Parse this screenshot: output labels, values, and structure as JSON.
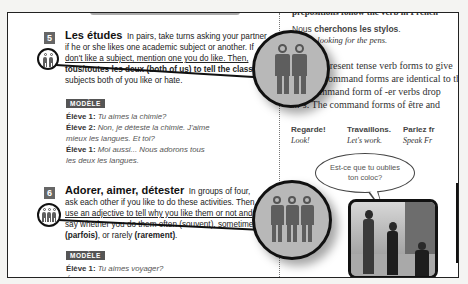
{
  "left_page": {
    "exercise5": {
      "number": "5",
      "title": "Les études",
      "icon": "pair-icon",
      "instructions_line1": "In pairs, take turns asking your partner",
      "instructions_line2": "if he or she likes one academic subject or another. If",
      "instructions_line3": "don't like a subject, mention one you do like. Then,",
      "instructions_line4": "tous/toutes les deux (both of us) to tell the class",
      "instructions_line5": "subjects both of you like or hate.",
      "modele_label": "MODÈLE",
      "dialog": [
        {
          "speaker": "Élève 1:",
          "line": "Tu aimes la chimie?"
        },
        {
          "speaker": "Élève 2:",
          "line": "Non, je déteste la chimie. J'aime"
        },
        {
          "speaker": "",
          "line": "mieux les langues. Et toi?"
        },
        {
          "speaker": "Élève 1:",
          "line": "Moi aussi... Nous adorons tous"
        },
        {
          "speaker": "",
          "line": "les deux les langues."
        }
      ]
    },
    "exercise6": {
      "number": "6",
      "title": "Adorer, aimer, détester",
      "icon": "group-icon",
      "instructions_line1": "In groups of four,",
      "instructions_line2": "ask each other if you like to do these activities. Then",
      "instructions_line3": "use an adjective to tell why you like them or not and",
      "instructions_line4": "say whether you do them often (souvent), sometimes",
      "instructions_line5_a": "(parfois)",
      "instructions_line5_b": ", or rarely ",
      "instructions_line5_c": "(rarement)",
      "instructions_line5_d": ".",
      "modele_label": "MODÈLE",
      "dialog": [
        {
          "speaker": "Élève 1:",
          "line": "Tu aimes voyager?"
        },
        {
          "speaker": "Élève 2:",
          "line": "Oui. J'adore voyager. C'est amusant!"
        }
      ]
    }
  },
  "right_page": {
    "top_cut_text": "prepositions follow the verb in French",
    "example_fr_a": "Nous ",
    "example_fr_b": "cherchons les stylos",
    "example_fr_c": ".",
    "example_en": "We are looking for the pens.",
    "para_line1": "Use the present tense verb forms to give",
    "para_line2": "and the command forms are identical to the",
    "para_line3": "The command form of -er verbs drop",
    "para_line4": "...-s. The command forms of être and",
    "commands": [
      {
        "fr": "Regarde!",
        "en": "Look!"
      },
      {
        "fr": "Travaillons.",
        "en": "Let's work."
      },
      {
        "fr": "Parlez fr",
        "en": "Speak Fr"
      }
    ],
    "speech_bubble_line1": "Est-ce que tu oublies",
    "speech_bubble_line2": "ton coloc?"
  },
  "callouts": {
    "pair_magnified": "pair-icon-magnified",
    "group_magnified": "group-icon-magnified"
  },
  "colors": {
    "badge": "#666666",
    "modele_bg": "#555555",
    "callout_fill": "#b8b8b8",
    "figure": "#5e5e5e"
  }
}
